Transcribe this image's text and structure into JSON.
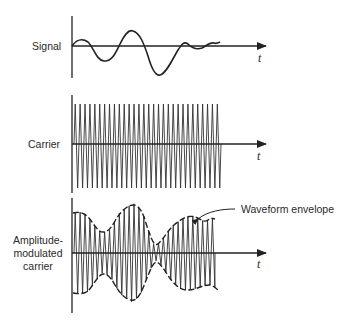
{
  "diagram": {
    "panels": [
      {
        "label": "Signal",
        "axis_label": "t"
      },
      {
        "label": "Carrier",
        "axis_label": "t"
      },
      {
        "label_lines": [
          "Amplitude-",
          "modulated",
          "carrier"
        ],
        "axis_label": "t",
        "annotation": "Waveform envelope"
      }
    ],
    "colors": {
      "ink": "#222222",
      "background": "#ffffff"
    }
  }
}
